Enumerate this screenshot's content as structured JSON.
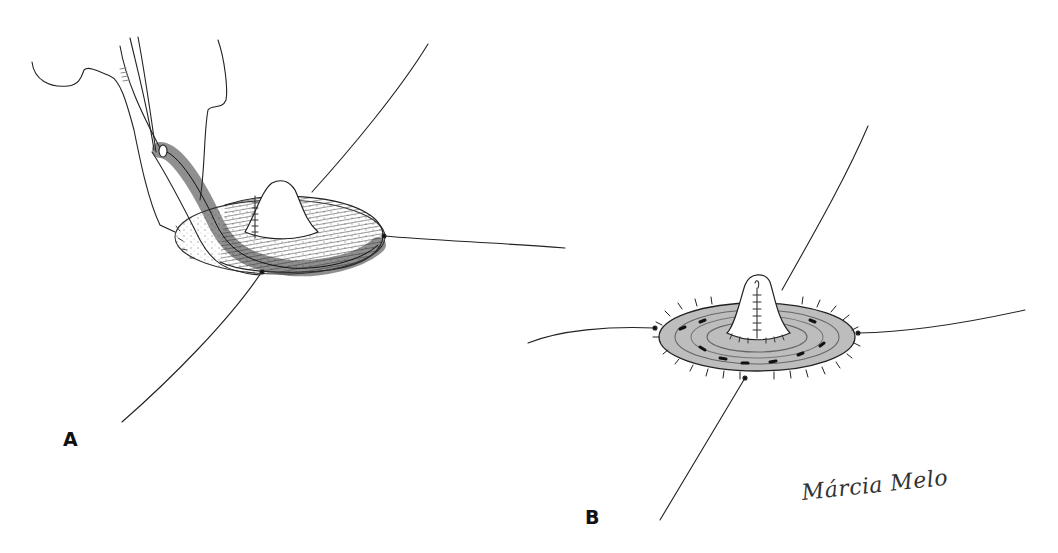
{
  "figure": {
    "panels": [
      {
        "label": "A",
        "description": "Flap being rotated around stoma cone with sutures and traction threads"
      },
      {
        "label": "B",
        "description": "Completed circular flap around stoma cone with interrupted sutures and four traction threads"
      }
    ],
    "signature": "Márcia Melo",
    "colors": {
      "background": "#ffffff",
      "line": "#222222",
      "shading": "#777777"
    }
  }
}
